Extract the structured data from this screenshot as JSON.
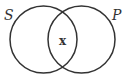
{
  "diagram": {
    "type": "venn",
    "circles": [
      {
        "label": "S",
        "cx": 43.5,
        "cy": 39.5,
        "r": 33.5
      },
      {
        "label": "P",
        "cx": 81.5,
        "cy": 39.5,
        "r": 33.5
      }
    ],
    "intersection_mark": "x",
    "stroke_color": "#333333"
  }
}
